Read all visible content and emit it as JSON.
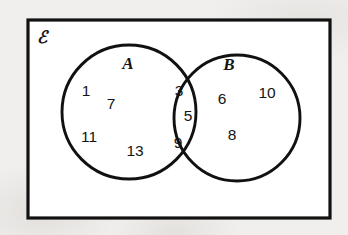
{
  "diagram": {
    "type": "venn",
    "title": "",
    "universe_label": "ℰ",
    "universe_label_name": "universal-set-symbol",
    "background_color": "#f1efed",
    "box_fill_color": "#ffffff",
    "stroke_color": "#111111",
    "sets": [
      {
        "key": "A",
        "label": "A",
        "cx": 129,
        "cy": 112,
        "r": 67
      },
      {
        "key": "B",
        "label": "B",
        "cx": 237,
        "cy": 118,
        "r": 63
      }
    ],
    "universe_box": {
      "x": 28,
      "y": 20,
      "width": 302,
      "height": 198
    },
    "regions": {
      "a_only": {
        "name": "A only",
        "values": [
          1,
          7,
          11,
          13
        ]
      },
      "intersection": {
        "name": "A and B",
        "values": [
          3,
          5,
          9
        ]
      },
      "b_only": {
        "name": "B only",
        "values": [
          6,
          10,
          8
        ]
      },
      "outside": {
        "name": "Outside A and B",
        "values": []
      }
    },
    "elements": [
      {
        "id": "n1",
        "text": "1",
        "x": 86,
        "y": 92,
        "region": "a_only"
      },
      {
        "id": "n7",
        "text": "7",
        "x": 111,
        "y": 105,
        "region": "a_only"
      },
      {
        "id": "n11",
        "text": "11",
        "x": 89,
        "y": 138,
        "region": "a_only"
      },
      {
        "id": "n13",
        "text": "13",
        "x": 135,
        "y": 152,
        "region": "a_only"
      },
      {
        "id": "n3",
        "text": "3",
        "x": 179,
        "y": 92,
        "region": "intersection"
      },
      {
        "id": "n5",
        "text": "5",
        "x": 188,
        "y": 117,
        "region": "intersection"
      },
      {
        "id": "n9",
        "text": "9",
        "x": 178,
        "y": 144,
        "region": "intersection"
      },
      {
        "id": "n6",
        "text": "6",
        "x": 222,
        "y": 100,
        "region": "b_only"
      },
      {
        "id": "n10",
        "text": "10",
        "x": 267,
        "y": 94,
        "region": "b_only"
      },
      {
        "id": "n8",
        "text": "8",
        "x": 232,
        "y": 136,
        "region": "b_only"
      }
    ],
    "labels": [
      {
        "id": "labelA",
        "text": "A",
        "x": 128,
        "y": 65
      },
      {
        "id": "labelB",
        "text": "B",
        "x": 229,
        "y": 66
      }
    ]
  }
}
